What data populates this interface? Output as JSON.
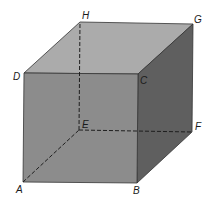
{
  "diagram": {
    "type": "cube",
    "vertices": {
      "A": {
        "label": "A",
        "x": 23,
        "y": 182
      },
      "B": {
        "label": "B",
        "x": 137,
        "y": 183
      },
      "C": {
        "label": "C",
        "x": 138,
        "y": 74
      },
      "D": {
        "label": "D",
        "x": 24,
        "y": 73
      },
      "E": {
        "label": "E",
        "x": 79,
        "y": 130
      },
      "F": {
        "label": "F",
        "x": 192,
        "y": 132
      },
      "G": {
        "label": "G",
        "x": 193,
        "y": 24
      },
      "H": {
        "label": "H",
        "x": 80,
        "y": 22
      }
    },
    "hidden_edges": [
      "AE",
      "EF",
      "EH"
    ],
    "colors": {
      "front_face": "#8c8c8c",
      "top_face": "#ababab",
      "right_face": "#5f5f5f",
      "edge": "#2a2a2a"
    }
  }
}
